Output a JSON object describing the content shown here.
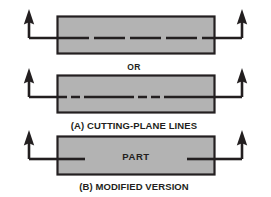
{
  "figure": {
    "background_color": "#ffffff",
    "part_fill_color": "#b3b3b3",
    "line_color": "#231f20",
    "panels": [
      {
        "id": "panel-a-top",
        "label": "",
        "part_label": "",
        "line_style": "dashed-even",
        "rect": {
          "x": 57,
          "y": 16,
          "w": 158,
          "h": 38
        },
        "cutting_line_y": 38,
        "left_arrow": {
          "stem_x": 29,
          "tip_y": 10,
          "corner_y": 38
        },
        "right_arrow": {
          "stem_x": 242,
          "tip_y": 10,
          "corner_y": 38
        }
      },
      {
        "id": "panel-a-bottom",
        "label": "",
        "part_label": "",
        "line_style": "long-short-dash",
        "rect": {
          "x": 57,
          "y": 75,
          "w": 158,
          "h": 38
        },
        "cutting_line_y": 97,
        "left_arrow": {
          "stem_x": 29,
          "tip_y": 69,
          "corner_y": 97
        },
        "right_arrow": {
          "stem_x": 242,
          "tip_y": 69,
          "corner_y": 97
        }
      },
      {
        "id": "panel-b",
        "label": "",
        "part_label": "PART",
        "line_style": "short-stubs",
        "rect": {
          "x": 57,
          "y": 136,
          "w": 158,
          "h": 39
        },
        "cutting_line_y": 159,
        "left_arrow": {
          "stem_x": 29,
          "tip_y": 130,
          "corner_y": 159
        },
        "right_arrow": {
          "stem_x": 242,
          "tip_y": 130,
          "corner_y": 159
        }
      }
    ],
    "captions": {
      "or": "OR",
      "caption_a": "(A) CUTTING-PLANE LINES",
      "caption_b": "(B) MODIFIED VERSION"
    },
    "labels": {
      "part": "PART"
    }
  }
}
